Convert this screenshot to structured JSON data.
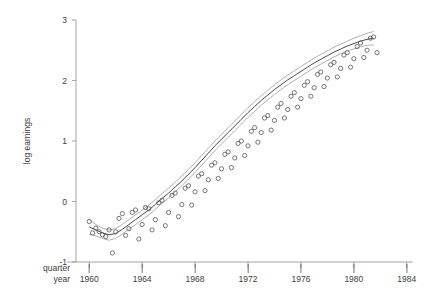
{
  "chart_data": {
    "type": "scatter",
    "title": "",
    "subtitle": "",
    "xlabel": "year",
    "xlabel_secondary": "quarter",
    "ylabel": "log earnings",
    "xlim": [
      1959.0,
      1985.0
    ],
    "ylim": [
      -1,
      3
    ],
    "xticks": [
      1960,
      1964,
      1968,
      1972,
      1976,
      1980,
      1984
    ],
    "xtick_labels": [
      "1960",
      "1964",
      "1968",
      "1972",
      "1976",
      "1980",
      "1984"
    ],
    "yticks": [
      -1,
      0,
      1,
      2,
      3
    ],
    "ytick_labels": [
      "-1",
      "0",
      "1",
      "2",
      "3"
    ],
    "grid": false,
    "legend": null,
    "marker": "open-circle",
    "marker_radius": 2.1,
    "colors": {
      "marker": "#555555",
      "fit_line": "#4a4a4a",
      "confidence_band": "#8e8e8e",
      "axis": "#9a9a9a",
      "text": "#3d3d3d",
      "background": "#ffffff"
    },
    "series": [
      {
        "name": "log earnings (quarterly observations)",
        "type": "scatter",
        "points": [
          [
            1960.0,
            -0.33
          ],
          [
            1960.25,
            -0.52
          ],
          [
            1960.5,
            -0.44
          ],
          [
            1960.75,
            -0.5
          ],
          [
            1961.0,
            -0.55
          ],
          [
            1961.25,
            -0.58
          ],
          [
            1961.5,
            -0.47
          ],
          [
            1961.75,
            -0.85
          ],
          [
            1962.0,
            -0.5
          ],
          [
            1962.25,
            -0.28
          ],
          [
            1962.5,
            -0.2
          ],
          [
            1962.75,
            -0.56
          ],
          [
            1963.0,
            -0.45
          ],
          [
            1963.25,
            -0.18
          ],
          [
            1963.5,
            -0.14
          ],
          [
            1963.75,
            -0.62
          ],
          [
            1964.0,
            -0.38
          ],
          [
            1964.25,
            -0.1
          ],
          [
            1964.5,
            -0.12
          ],
          [
            1964.75,
            -0.47
          ],
          [
            1965.0,
            -0.3
          ],
          [
            1965.25,
            -0.02
          ],
          [
            1965.5,
            0.02
          ],
          [
            1965.75,
            -0.4
          ],
          [
            1966.0,
            -0.18
          ],
          [
            1966.25,
            0.1
          ],
          [
            1966.5,
            0.14
          ],
          [
            1966.75,
            -0.25
          ],
          [
            1967.0,
            -0.05
          ],
          [
            1967.25,
            0.22
          ],
          [
            1967.5,
            0.26
          ],
          [
            1967.75,
            -0.06
          ],
          [
            1968.0,
            0.16
          ],
          [
            1968.25,
            0.42
          ],
          [
            1968.5,
            0.46
          ],
          [
            1968.75,
            0.18
          ],
          [
            1969.0,
            0.36
          ],
          [
            1969.25,
            0.6
          ],
          [
            1969.5,
            0.64
          ],
          [
            1969.75,
            0.38
          ],
          [
            1970.0,
            0.54
          ],
          [
            1970.25,
            0.78
          ],
          [
            1970.5,
            0.82
          ],
          [
            1970.75,
            0.56
          ],
          [
            1971.0,
            0.72
          ],
          [
            1971.25,
            0.96
          ],
          [
            1971.5,
            1.0
          ],
          [
            1971.75,
            0.76
          ],
          [
            1972.0,
            0.92
          ],
          [
            1972.25,
            1.16
          ],
          [
            1972.5,
            1.22
          ],
          [
            1972.75,
            0.98
          ],
          [
            1973.0,
            1.14
          ],
          [
            1973.25,
            1.38
          ],
          [
            1973.5,
            1.42
          ],
          [
            1973.75,
            1.18
          ],
          [
            1974.0,
            1.34
          ],
          [
            1974.25,
            1.56
          ],
          [
            1974.5,
            1.62
          ],
          [
            1974.75,
            1.38
          ],
          [
            1975.0,
            1.52
          ],
          [
            1975.25,
            1.74
          ],
          [
            1975.5,
            1.8
          ],
          [
            1975.75,
            1.56
          ],
          [
            1976.0,
            1.7
          ],
          [
            1976.25,
            1.92
          ],
          [
            1976.5,
            1.98
          ],
          [
            1976.75,
            1.74
          ],
          [
            1977.0,
            1.88
          ],
          [
            1977.25,
            2.1
          ],
          [
            1977.5,
            2.14
          ],
          [
            1977.75,
            1.9
          ],
          [
            1978.0,
            2.04
          ],
          [
            1978.25,
            2.26
          ],
          [
            1978.5,
            2.3
          ],
          [
            1978.75,
            2.06
          ],
          [
            1979.0,
            2.2
          ],
          [
            1979.25,
            2.42
          ],
          [
            1979.5,
            2.46
          ],
          [
            1979.75,
            2.22
          ],
          [
            1980.0,
            2.36
          ],
          [
            1980.25,
            2.56
          ],
          [
            1980.5,
            2.62
          ],
          [
            1980.75,
            2.38
          ],
          [
            1981.0,
            2.5
          ],
          [
            1981.25,
            2.7
          ],
          [
            1981.5,
            2.72
          ],
          [
            1981.75,
            2.46
          ]
        ]
      },
      {
        "name": "fitted curve",
        "type": "line",
        "points": [
          [
            1960.0,
            -0.42
          ],
          [
            1960.5,
            -0.47
          ],
          [
            1961.0,
            -0.52
          ],
          [
            1961.5,
            -0.55
          ],
          [
            1962.0,
            -0.53
          ],
          [
            1962.5,
            -0.46
          ],
          [
            1963.0,
            -0.38
          ],
          [
            1963.5,
            -0.3
          ],
          [
            1964.0,
            -0.22
          ],
          [
            1964.5,
            -0.14
          ],
          [
            1965.0,
            -0.05
          ],
          [
            1965.5,
            0.05
          ],
          [
            1966.0,
            0.14
          ],
          [
            1966.5,
            0.24
          ],
          [
            1967.0,
            0.34
          ],
          [
            1967.5,
            0.45
          ],
          [
            1968.0,
            0.56
          ],
          [
            1968.5,
            0.68
          ],
          [
            1969.0,
            0.8
          ],
          [
            1969.5,
            0.92
          ],
          [
            1970.0,
            1.03
          ],
          [
            1970.5,
            1.14
          ],
          [
            1971.0,
            1.25
          ],
          [
            1971.5,
            1.36
          ],
          [
            1972.0,
            1.47
          ],
          [
            1972.5,
            1.57
          ],
          [
            1973.0,
            1.67
          ],
          [
            1973.5,
            1.76
          ],
          [
            1974.0,
            1.85
          ],
          [
            1974.5,
            1.93
          ],
          [
            1975.0,
            2.01
          ],
          [
            1975.5,
            2.08
          ],
          [
            1976.0,
            2.15
          ],
          [
            1976.5,
            2.22
          ],
          [
            1977.0,
            2.29
          ],
          [
            1977.5,
            2.35
          ],
          [
            1978.0,
            2.41
          ],
          [
            1978.5,
            2.47
          ],
          [
            1979.0,
            2.52
          ],
          [
            1979.5,
            2.57
          ],
          [
            1980.0,
            2.61
          ],
          [
            1980.5,
            2.65
          ],
          [
            1981.0,
            2.68
          ],
          [
            1981.5,
            2.7
          ]
        ]
      },
      {
        "name": "confidence band upper",
        "type": "line",
        "points": [
          [
            1960.0,
            -0.3
          ],
          [
            1960.5,
            -0.38
          ],
          [
            1961.0,
            -0.44
          ],
          [
            1961.5,
            -0.47
          ],
          [
            1962.0,
            -0.45
          ],
          [
            1962.5,
            -0.38
          ],
          [
            1963.0,
            -0.3
          ],
          [
            1963.5,
            -0.22
          ],
          [
            1964.0,
            -0.14
          ],
          [
            1964.5,
            -0.06
          ],
          [
            1965.0,
            0.03
          ],
          [
            1965.5,
            0.13
          ],
          [
            1966.0,
            0.22
          ],
          [
            1966.5,
            0.32
          ],
          [
            1967.0,
            0.42
          ],
          [
            1967.5,
            0.53
          ],
          [
            1968.0,
            0.64
          ],
          [
            1968.5,
            0.76
          ],
          [
            1969.0,
            0.88
          ],
          [
            1969.5,
            1.0
          ],
          [
            1970.0,
            1.11
          ],
          [
            1970.5,
            1.22
          ],
          [
            1971.0,
            1.33
          ],
          [
            1971.5,
            1.44
          ],
          [
            1972.0,
            1.55
          ],
          [
            1972.5,
            1.65
          ],
          [
            1973.0,
            1.75
          ],
          [
            1973.5,
            1.84
          ],
          [
            1974.0,
            1.93
          ],
          [
            1974.5,
            2.01
          ],
          [
            1975.0,
            2.09
          ],
          [
            1975.5,
            2.16
          ],
          [
            1976.0,
            2.23
          ],
          [
            1976.5,
            2.3
          ],
          [
            1977.0,
            2.37
          ],
          [
            1977.5,
            2.43
          ],
          [
            1978.0,
            2.49
          ],
          [
            1978.5,
            2.55
          ],
          [
            1979.0,
            2.6
          ],
          [
            1979.5,
            2.65
          ],
          [
            1980.0,
            2.7
          ],
          [
            1980.5,
            2.74
          ],
          [
            1981.0,
            2.78
          ],
          [
            1981.5,
            2.81
          ]
        ]
      },
      {
        "name": "confidence band lower",
        "type": "line",
        "points": [
          [
            1960.0,
            -0.54
          ],
          [
            1960.5,
            -0.57
          ],
          [
            1961.0,
            -0.61
          ],
          [
            1961.5,
            -0.64
          ],
          [
            1962.0,
            -0.61
          ],
          [
            1962.5,
            -0.54
          ],
          [
            1963.0,
            -0.46
          ],
          [
            1963.5,
            -0.38
          ],
          [
            1964.0,
            -0.3
          ],
          [
            1964.5,
            -0.22
          ],
          [
            1965.0,
            -0.13
          ],
          [
            1965.5,
            -0.03
          ],
          [
            1966.0,
            0.06
          ],
          [
            1966.5,
            0.16
          ],
          [
            1967.0,
            0.26
          ],
          [
            1967.5,
            0.37
          ],
          [
            1968.0,
            0.48
          ],
          [
            1968.5,
            0.6
          ],
          [
            1969.0,
            0.72
          ],
          [
            1969.5,
            0.84
          ],
          [
            1970.0,
            0.95
          ],
          [
            1970.5,
            1.06
          ],
          [
            1971.0,
            1.17
          ],
          [
            1971.5,
            1.28
          ],
          [
            1972.0,
            1.39
          ],
          [
            1972.5,
            1.49
          ],
          [
            1973.0,
            1.59
          ],
          [
            1973.5,
            1.68
          ],
          [
            1974.0,
            1.77
          ],
          [
            1974.5,
            1.85
          ],
          [
            1975.0,
            1.93
          ],
          [
            1975.5,
            2.0
          ],
          [
            1976.0,
            2.07
          ],
          [
            1976.5,
            2.14
          ],
          [
            1977.0,
            2.21
          ],
          [
            1977.5,
            2.27
          ],
          [
            1978.0,
            2.33
          ],
          [
            1978.5,
            2.39
          ],
          [
            1979.0,
            2.44
          ],
          [
            1979.5,
            2.49
          ],
          [
            1980.0,
            2.52
          ],
          [
            1980.5,
            2.56
          ],
          [
            1981.0,
            2.58
          ],
          [
            1981.5,
            2.59
          ]
        ]
      }
    ]
  }
}
